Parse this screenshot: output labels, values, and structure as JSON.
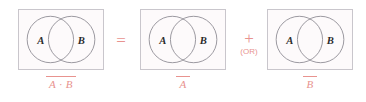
{
  "figure": {
    "colors": {
      "accent": "#e8938f",
      "panel_border": "#c9c6cc",
      "panel_fill": "#fdfafb",
      "circle_stroke": "#8d8a93",
      "letter": "#2b2b2b"
    }
  },
  "panels": [
    {
      "id": "panel-1",
      "left_circle_label": "A",
      "right_circle_label": "B",
      "caption": "A · B",
      "caption_overbar": true
    },
    {
      "id": "panel-2",
      "left_circle_label": "A",
      "right_circle_label": "B",
      "caption": "A",
      "caption_overbar": true
    },
    {
      "id": "panel-3",
      "left_circle_label": "A",
      "right_circle_label": "B",
      "caption": "B",
      "caption_overbar": true
    }
  ],
  "operators": {
    "equals": "=",
    "plus": "+",
    "plus_note": "(OR)"
  }
}
